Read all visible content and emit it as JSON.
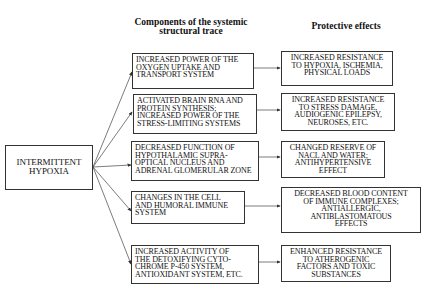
{
  "headers": {
    "components": "Components of the systemic\nstructural trace",
    "effects": "Protective effects"
  },
  "source": {
    "label": "INTERMITTENT\nHYPOXIA"
  },
  "components": [
    {
      "label": "INCREASED POWER OF THE\nOXYGEN UPTAKE AND\nTRANSPORT SYSTEM"
    },
    {
      "label": "ACTIVATED BRAIN RNA AND\nPROTEIN SYNTHESIS;\nINCREASED POWER OF THE\nSTRESS-LIMITING SYSTEMS"
    },
    {
      "label": "DECREASED FUNCTION OF\nHYPOTHALAMIC SUPRA-\nOPTICAL NUCLEUS AND\nADRENAL GLOMERULAR ZONE"
    },
    {
      "label": "CHANGES IN THE CELL\nAND HUMORAL IMMUNE\nSYSTEM"
    },
    {
      "label": "INCREASED ACTIVITY OF\nTHE DETOXIFYING CYTO-\nCHROME P-450 SYSTEM,\nANTIOXIDANT SYSTEM, ETC."
    }
  ],
  "effects": [
    {
      "label": "INCREASED RESISTANCE\nTO HYPOXIA, ISCHEMIA,\nPHYSICAL LOADS"
    },
    {
      "label": "INCREASED RESISTANCE\nTO STRESS DAMAGE,\nAUDIOGENIC EPILEPSY,\nNEUROSES, ETC."
    },
    {
      "label": "CHANGED RESERVE OF\nNaCl AND WATER;\nANTIHYPERTENSIVE\nEFFECT"
    },
    {
      "label": "DECREASED BLOOD CONTENT\nOF IMMUNE COMPLEXES;\nANTIALLERGIC,\nANTIBLASTOMATOUS\nEFFECTS"
    },
    {
      "label": "ENHANCED RESISTANCE\nTO ATHEROGENIC\nFACTORS AND TOXIC\nSUBSTANCES"
    }
  ]
}
